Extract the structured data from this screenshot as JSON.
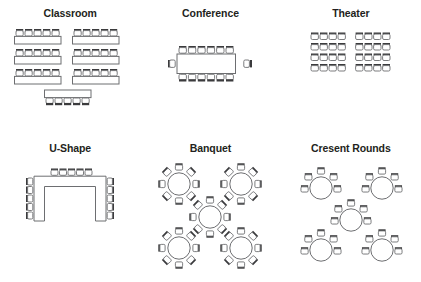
{
  "page": {
    "kind": "seating-layout-diagram-sheet",
    "background_color": "#ffffff",
    "outline_color": "#6d6e71",
    "seat_back_color": "#3b3b3d",
    "text_color": "#231f20"
  },
  "layouts": [
    {
      "id": "classroom",
      "title": "Classroom",
      "description": "Rows of rectangular tables with chairs on one side",
      "table_shape": "rectangle",
      "row_count": 3,
      "columns_of_tables": 2,
      "seats_per_table": 5,
      "extra_front_table": {
        "present": true,
        "seats": 5,
        "seat_side": "bottom"
      },
      "total_seats": 35
    },
    {
      "id": "conference",
      "title": "Conference",
      "description": "Single long boardroom table with seats all around",
      "table_shape": "rectangle",
      "seats_top": 6,
      "seats_bottom": 6,
      "seats_left": 1,
      "seats_right": 1,
      "total_seats": 14
    },
    {
      "id": "theater",
      "title": "Theater",
      "description": "Chairs only, in rows with a centre aisle",
      "table_shape": "none",
      "rows": 4,
      "blocks": 2,
      "seats_per_block_per_row": 4,
      "total_seats": 32
    },
    {
      "id": "u-shape",
      "title": "U-Shape",
      "description": "Tables arranged in an open U with seats on the outside",
      "table_shape": "u",
      "seats_top": 5,
      "seats_left": 5,
      "seats_right": 5,
      "total_seats": 15
    },
    {
      "id": "banquet",
      "title": "Banquet",
      "description": "Round tables fully surrounded by chairs",
      "table_shape": "round",
      "table_count": 5,
      "table_arrangement": "four corners plus one centre",
      "seats_per_table": 8,
      "total_seats": 40
    },
    {
      "id": "cresent-rounds",
      "title": "Cresent Rounds",
      "description": "Round tables with chairs on the back half only",
      "table_shape": "round",
      "table_count": 5,
      "table_arrangement": "four corners plus one centre",
      "seats_per_table": 5,
      "total_seats": 25
    }
  ]
}
